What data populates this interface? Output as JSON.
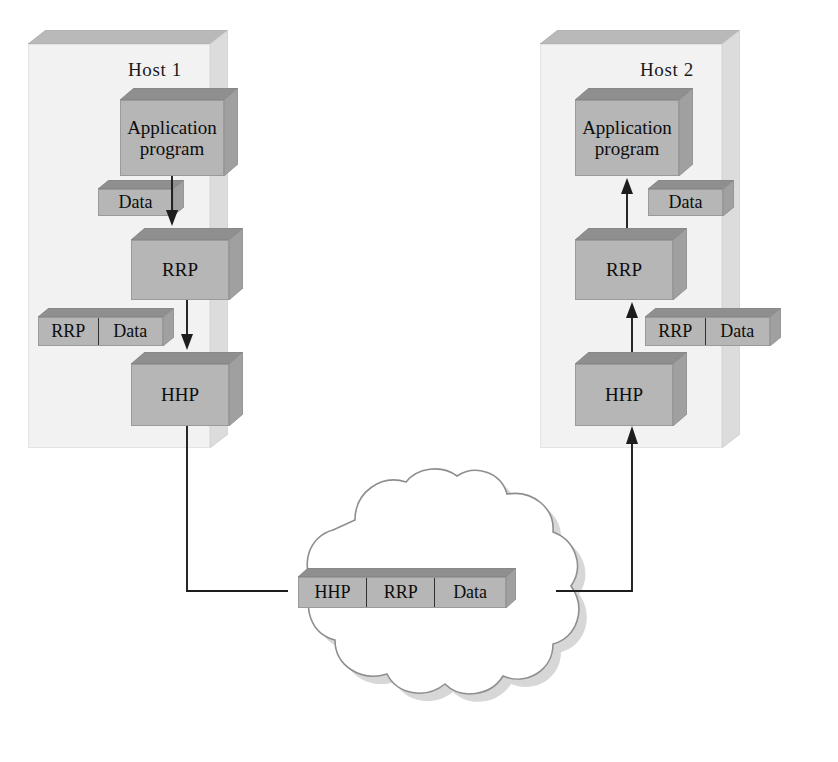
{
  "diagram": {
    "background_color": "#ffffff",
    "line_color": "#1d1d1d",
    "box_fill": "#b6b6b6",
    "panel_fill": "#f2f2f2",
    "panel_top_fill": "#b9b9b9"
  },
  "hosts": [
    {
      "id": "host1",
      "label": "Host 1",
      "direction": "send",
      "layers": [
        {
          "id": "app",
          "label": "Application\nprogram",
          "line1": "Application",
          "line2": "program"
        },
        {
          "id": "rrp",
          "label": "RRP"
        },
        {
          "id": "hhp",
          "label": "HHP"
        }
      ],
      "packets": [
        {
          "id": "data",
          "side": "left",
          "fields": [
            "Data"
          ]
        },
        {
          "id": "rrp-data",
          "side": "left",
          "fields": [
            "RRP",
            "Data"
          ]
        }
      ]
    },
    {
      "id": "host2",
      "label": "Host 2",
      "direction": "receive",
      "layers": [
        {
          "id": "app",
          "label": "Application\nprogram",
          "line1": "Application",
          "line2": "program"
        },
        {
          "id": "rrp",
          "label": "RRP"
        },
        {
          "id": "hhp",
          "label": "HHP"
        }
      ],
      "packets": [
        {
          "id": "data",
          "side": "right",
          "fields": [
            "Data"
          ]
        },
        {
          "id": "rrp-data",
          "side": "right",
          "fields": [
            "RRP",
            "Data"
          ]
        }
      ]
    }
  ],
  "network": {
    "id": "cloud",
    "shape": "cloud",
    "packet": {
      "id": "network-packet",
      "fields": [
        "HHP",
        "RRP",
        "Data"
      ]
    }
  },
  "labels": {
    "application_line1": "Application",
    "application_line2": "program",
    "rrp": "RRP",
    "hhp": "HHP",
    "data": "Data",
    "host1": "Host 1",
    "host2": "Host 2",
    "net_hhp": "HHP",
    "net_rrp": "RRP",
    "net_data": "Data"
  }
}
